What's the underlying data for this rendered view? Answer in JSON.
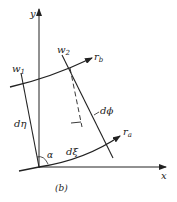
{
  "diagram": {
    "caption": "(b)",
    "axes": {
      "x_label": "x",
      "y_label": "y"
    },
    "labels": {
      "w1": "w",
      "w1_sub": "1",
      "w2": "w",
      "w2_sub": "2",
      "rb": "r",
      "rb_sub": "b",
      "ra": "r",
      "ra_sub": "a",
      "d_eta": "dη",
      "d_xi": "dξ",
      "d_phi": "dϕ",
      "alpha": "α"
    },
    "colors": {
      "line": "#222222",
      "background": "#ffffff"
    }
  }
}
